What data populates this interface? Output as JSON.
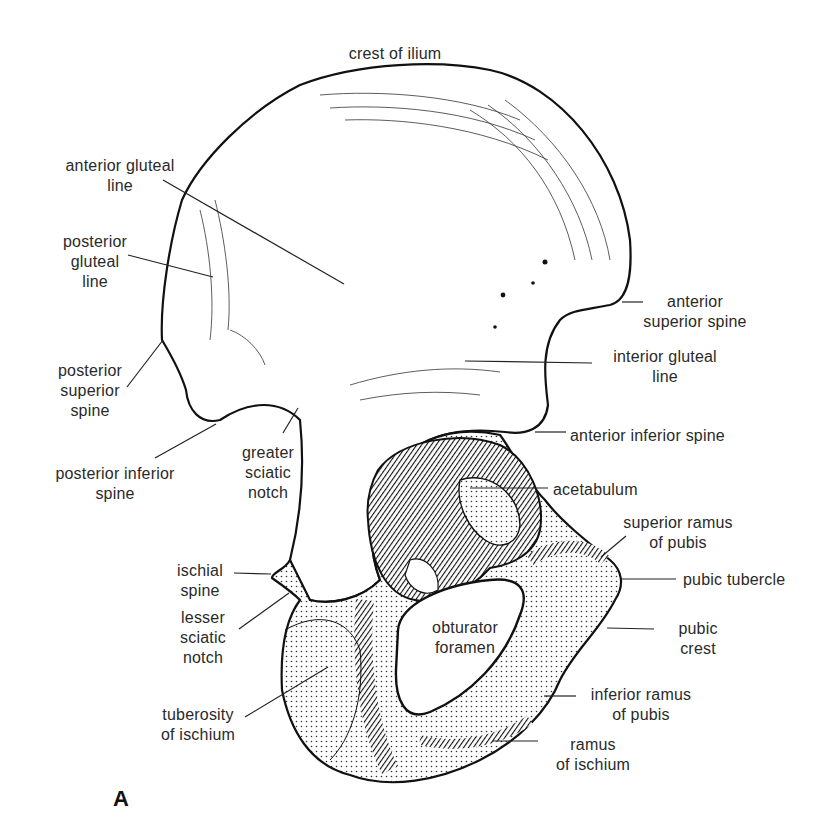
{
  "figure": {
    "panel_letter": "A",
    "labels": [
      {
        "id": "crest-of-ilium",
        "text": "crest of ilium",
        "x": 310,
        "y": 44,
        "w": 170,
        "align": "c"
      },
      {
        "id": "anterior-gluteal-line",
        "text": "anterior gluteal\nline",
        "x": 50,
        "y": 156,
        "w": 140,
        "align": "c"
      },
      {
        "id": "posterior-gluteal-line",
        "text": "posterior\ngluteal\nline",
        "x": 50,
        "y": 232,
        "w": 90,
        "align": "c"
      },
      {
        "id": "anterior-superior-spine",
        "text": "anterior\nsuperior spine",
        "x": 625,
        "y": 292,
        "w": 140,
        "align": "c"
      },
      {
        "id": "posterior-superior-spine",
        "text": "posterior\nsuperior\nspine",
        "x": 40,
        "y": 361,
        "w": 100,
        "align": "c"
      },
      {
        "id": "interior-gluteal-line",
        "text": "interior gluteal\nline",
        "x": 595,
        "y": 347,
        "w": 140,
        "align": "c"
      },
      {
        "id": "anterior-inferior-spine",
        "text": "anterior inferior spine",
        "x": 570,
        "y": 426,
        "w": 200,
        "align": "l"
      },
      {
        "id": "greater-sciatic-notch",
        "text": "greater\nsciatic\nnotch",
        "x": 228,
        "y": 443,
        "w": 80,
        "align": "c"
      },
      {
        "id": "posterior-inferior-spine",
        "text": "posterior inferior\nspine",
        "x": 30,
        "y": 464,
        "w": 170,
        "align": "c"
      },
      {
        "id": "acetabulum",
        "text": "acetabulum",
        "x": 553,
        "y": 480,
        "w": 120,
        "align": "l"
      },
      {
        "id": "superior-ramus-of-pubis",
        "text": "superior ramus\nof pubis",
        "x": 608,
        "y": 513,
        "w": 140,
        "align": "c"
      },
      {
        "id": "ischial-spine",
        "text": "ischial\nspine",
        "x": 160,
        "y": 561,
        "w": 80,
        "align": "c"
      },
      {
        "id": "pubic-tubercle",
        "text": "pubic tubercle",
        "x": 683,
        "y": 570,
        "w": 130,
        "align": "l"
      },
      {
        "id": "lesser-sciatic-notch",
        "text": "lesser\nsciatic\nnotch",
        "x": 168,
        "y": 608,
        "w": 70,
        "align": "c"
      },
      {
        "id": "obturator-foramen",
        "text": "obturator\nforamen",
        "x": 415,
        "y": 618,
        "w": 100,
        "align": "c"
      },
      {
        "id": "pubic-crest",
        "text": "pubic\ncrest",
        "x": 658,
        "y": 619,
        "w": 80,
        "align": "c"
      },
      {
        "id": "inferior-ramus-of-pubis",
        "text": "inferior ramus\nof pubis",
        "x": 576,
        "y": 685,
        "w": 130,
        "align": "c"
      },
      {
        "id": "tuberosity-of-ischium",
        "text": "tuberosity\nof ischium",
        "x": 148,
        "y": 705,
        "w": 100,
        "align": "c"
      },
      {
        "id": "ramus-of-ischium",
        "text": "ramus\nof ischium",
        "x": 538,
        "y": 735,
        "w": 110,
        "align": "c"
      }
    ],
    "leaders": [
      {
        "label": "anterior-gluteal-line",
        "x1": 163,
        "y1": 180,
        "x2": 344,
        "y2": 284
      },
      {
        "label": "posterior-gluteal-line",
        "x1": 128,
        "y1": 255,
        "x2": 213,
        "y2": 277
      },
      {
        "label": "posterior-superior-spine",
        "x1": 127,
        "y1": 387,
        "x2": 163,
        "y2": 340
      },
      {
        "label": "posterior-inferior-spine",
        "x1": 155,
        "y1": 458,
        "x2": 216,
        "y2": 424
      },
      {
        "label": "greater-sciatic-notch",
        "x1": 283,
        "y1": 433,
        "x2": 298,
        "y2": 408
      },
      {
        "label": "anterior-superior-spine",
        "x1": 622,
        "y1": 302,
        "x2": 643,
        "y2": 302
      },
      {
        "label": "interior-gluteal-line",
        "x1": 465,
        "y1": 361,
        "x2": 592,
        "y2": 363
      },
      {
        "label": "anterior-inferior-spine",
        "x1": 535,
        "y1": 432,
        "x2": 566,
        "y2": 432
      },
      {
        "label": "acetabulum",
        "x1": 470,
        "y1": 488,
        "x2": 548,
        "y2": 488
      },
      {
        "label": "superior-ramus-of-pubis",
        "x1": 601,
        "y1": 557,
        "x2": 626,
        "y2": 536
      },
      {
        "label": "pubic-tubercle",
        "x1": 621,
        "y1": 579,
        "x2": 676,
        "y2": 579
      },
      {
        "label": "pubic-crest",
        "x1": 607,
        "y1": 628,
        "x2": 654,
        "y2": 629
      },
      {
        "label": "inferior-ramus-of-pubis",
        "x1": 544,
        "y1": 696,
        "x2": 576,
        "y2": 696
      },
      {
        "label": "ramus-of-ischium",
        "x1": 492,
        "y1": 741,
        "x2": 538,
        "y2": 741
      },
      {
        "label": "ischial-spine",
        "x1": 234,
        "y1": 573,
        "x2": 271,
        "y2": 574
      },
      {
        "label": "lesser-sciatic-notch",
        "x1": 239,
        "y1": 629,
        "x2": 289,
        "y2": 593
      },
      {
        "label": "tuberosity-of-ischium",
        "x1": 245,
        "y1": 717,
        "x2": 328,
        "y2": 667
      }
    ]
  }
}
